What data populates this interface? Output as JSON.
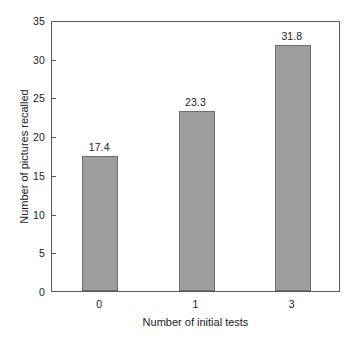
{
  "chart_data": {
    "type": "bar",
    "title": "",
    "subtitle": "",
    "xlabel": "Number of initial tests",
    "ylabel": "Number of pictures recalled",
    "categories": [
      "0",
      "1",
      "3"
    ],
    "values": [
      17.4,
      23.3,
      31.8
    ],
    "data_labels": [
      "17.4",
      "23.3",
      "31.8"
    ],
    "ylim": [
      0,
      35
    ],
    "yticks": [
      0,
      5,
      10,
      15,
      20,
      25,
      30,
      35
    ],
    "ytick_labels": [
      "0",
      "5",
      "10",
      "15",
      "20",
      "25",
      "30",
      "35"
    ],
    "grid": false,
    "legend": null,
    "legend_position": "none",
    "bar_fill_color": "#9e9e9e",
    "bar_edge_color": "#6d6d6d",
    "axis_color": "#58585a",
    "background_color": "#ffffff",
    "text_color": "#1a1a1a"
  }
}
